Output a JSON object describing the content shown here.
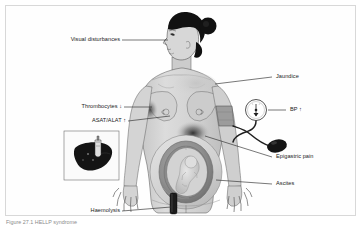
{
  "figure": {
    "caption": "Figure 27.1 HELLP syndrome",
    "border_color": "#d8d8d8",
    "background": "#ffffff",
    "ink": "#1a1a1a"
  },
  "labels": {
    "visual_disturbances": "Visual disturbances",
    "thrombocytes": "Thrombocytes ↓",
    "asat_alat": "ASAT/ALAT ↑",
    "haemolysis": "Haemolysis",
    "jaundice": "Jaundice",
    "bp": "BP ↑",
    "epigastric_pain": "Epigastric pain",
    "ascites": "Ascites"
  },
  "figure_elements": {
    "subject": "pregnant-woman-anterior-view",
    "head": "profile-head-facing-left-with-hair-bun",
    "inset_box": "liver-and-gallbladder-inset",
    "device": "sphygmomanometer-cuff-gauge-bulb",
    "fetus": "fetus-in-utero",
    "urine_sample": "dark-urine-sample-vial"
  },
  "colors": {
    "skin": "#d9d9d9",
    "skin_shade": "#bdbdbd",
    "hair": "#111111",
    "dark_organ": "#1b1b1b",
    "outline": "#4a4a4a",
    "leader": "#333333",
    "uterus": "#9a9a9a",
    "fetus": "#cfcfcf"
  }
}
